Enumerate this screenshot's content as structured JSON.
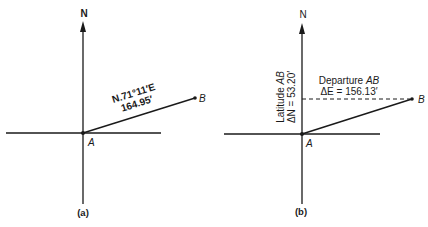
{
  "figure": {
    "panel_a": {
      "caption": "(a)",
      "north_label": "N",
      "origin_label": "A",
      "end_label": "B",
      "bearing": "N.71°11′E",
      "distance": "164.95′"
    },
    "panel_b": {
      "caption": "(b)",
      "north_label": "N",
      "origin_label": "A",
      "end_label": "B",
      "departure_label_prefix": "Departure ",
      "departure_label_line": "AB",
      "departure_value": "ΔE = 156.13′",
      "latitude_label_prefix": "Latitude ",
      "latitude_label_line": "AB",
      "latitude_value": "ΔN = 53.20′"
    },
    "colors": {
      "ink": "#1a1a1a",
      "background": "#ffffff"
    }
  }
}
